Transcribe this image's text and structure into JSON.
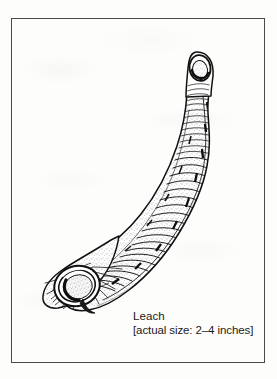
{
  "figure": {
    "kind": "scientific-line-illustration",
    "style": "black ink stipple and hatching on white",
    "border_color": "#4a4a4a",
    "ink_color": "#111111",
    "paper_color": "#fdfdfc",
    "orientation": "diagonal, anterior sucker upper-right, posterior sucker lower-left",
    "parts": [
      {
        "name": "anterior-sucker",
        "description": "small oval mouth sucker ring at narrow head end"
      },
      {
        "name": "body-segments",
        "description": "series of transverse annuli rings along the trunk"
      },
      {
        "name": "posterior-sucker",
        "description": "large thick-rimmed circular attachment disc at tail end"
      },
      {
        "name": "dorsal-markings",
        "description": "short dark dashes scattered along the body ridge"
      }
    ]
  },
  "caption": {
    "title": "Leach",
    "size_note": "[actual size: 2–4 inches]"
  }
}
